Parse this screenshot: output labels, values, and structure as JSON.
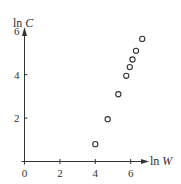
{
  "chart_data": {
    "type": "scatter",
    "title": "",
    "xlabel": "ln W",
    "ylabel": "ln C",
    "xlim": [
      0,
      7.5
    ],
    "ylim": [
      0,
      6
    ],
    "xticks": [
      0,
      2,
      4,
      6
    ],
    "yticks": [
      2,
      4,
      6
    ],
    "xtick_labels": [
      "0",
      "2",
      "4",
      "6"
    ],
    "ytick_labels": [
      "2",
      "4",
      "6"
    ],
    "grid": false,
    "legend": null,
    "marker": "open-circle",
    "series": [
      {
        "name": "data",
        "x": [
          4.0,
          4.7,
          5.3,
          5.75,
          5.95,
          6.1,
          6.3,
          6.65
        ],
        "y": [
          0.8,
          1.95,
          3.1,
          3.95,
          4.35,
          4.7,
          5.1,
          5.65
        ]
      }
    ]
  },
  "colors": {
    "axis": "#333333",
    "marker": "#333333",
    "background": "#ffffff"
  }
}
